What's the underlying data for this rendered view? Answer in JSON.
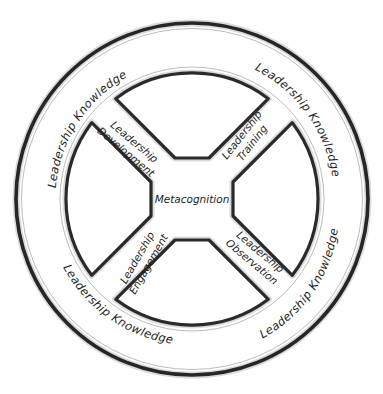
{
  "diagram": {
    "type": "concentric circular model",
    "outer_ring": {
      "labels": [
        {
          "text": "Leadership Knowledge",
          "position": "top-left"
        },
        {
          "text": "Leadership Knowledge",
          "position": "top-right"
        },
        {
          "text": "Leadership Knowledge",
          "position": "bottom-left"
        },
        {
          "text": "Leadership Knowledge",
          "position": "bottom-right"
        }
      ]
    },
    "spokes": [
      {
        "line1": "Leadership",
        "line2": "Development",
        "position": "upper-left"
      },
      {
        "line1": "Leadership",
        "line2": "Training",
        "position": "upper-right"
      },
      {
        "line1": "Leadership",
        "line2": "Engagement",
        "position": "lower-left"
      },
      {
        "line1": "Leadership",
        "line2": "Observation",
        "position": "lower-right"
      }
    ],
    "hub": {
      "text": "Metacognition"
    },
    "colors": {
      "stroke": "#2a2a2a",
      "background": "#ffffff",
      "text": "#1e1e1e"
    }
  }
}
